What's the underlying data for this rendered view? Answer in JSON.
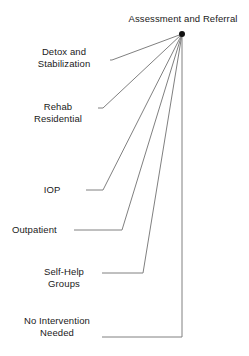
{
  "diagram": {
    "type": "fan-hierarchy",
    "title": "Assessment and Referral",
    "background_color": "#ffffff",
    "line_color": "#808080",
    "text_color": "#1a1a1a",
    "hub": {
      "label": "Assessment and Referral",
      "marker": "hub-dot",
      "x": 182,
      "y": 34
    },
    "branches": [
      {
        "id": "detox-and-stabilization",
        "label": "Detox and\nStabilization",
        "line1": "Detox and",
        "line2": "Stabilization",
        "align": "center",
        "label_x": 18,
        "label_y": 46,
        "label_width": 92,
        "elbow_x": 112,
        "elbow_y": 60
      },
      {
        "id": "rehab-residential",
        "label": "Rehab\nResidential",
        "line1": "Rehab",
        "line2": "Residential",
        "align": "center",
        "label_x": 18,
        "label_y": 101,
        "label_width": 80,
        "elbow_x": 103,
        "elbow_y": 108
      },
      {
        "id": "iop",
        "label": "IOP",
        "line1": "IOP",
        "line2": "",
        "align": "center",
        "label_x": 18,
        "label_y": 184,
        "label_width": 68,
        "elbow_x": 103,
        "elbow_y": 190
      },
      {
        "id": "outpatient",
        "label": "Outpatient",
        "line1": "Outpatient",
        "line2": "",
        "align": "left",
        "label_x": 12,
        "label_y": 224,
        "label_width": 62,
        "elbow_x": 122,
        "elbow_y": 230
      },
      {
        "id": "self-help-groups",
        "label": "Self-Help\nGroups",
        "line1": "Self-Help",
        "line2": "Groups",
        "align": "center",
        "label_x": 26,
        "label_y": 266,
        "label_width": 76,
        "elbow_x": 143,
        "elbow_y": 273
      },
      {
        "id": "no-intervention-needed",
        "label": "No Intervention\nNeeded",
        "line1": "No Intervention",
        "line2": "Needed",
        "align": "center",
        "label_x": 12,
        "label_y": 315,
        "label_width": 90,
        "elbow_x": 182,
        "elbow_y": 337
      }
    ]
  }
}
